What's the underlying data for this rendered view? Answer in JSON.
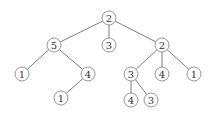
{
  "diagram": {
    "type": "tree",
    "style": {
      "edge_color": "#6e6e6e",
      "node_stroke": "#8a8a8a",
      "node_fill": "#ffffff",
      "label_color": "#333333",
      "node_radius": 7
    },
    "nodes": [
      {
        "id": "n0",
        "label": "2",
        "x": 109,
        "y": 18
      },
      {
        "id": "n1",
        "label": "5",
        "x": 54,
        "y": 45
      },
      {
        "id": "n2",
        "label": "3",
        "x": 109,
        "y": 45
      },
      {
        "id": "n3",
        "label": "2",
        "x": 162,
        "y": 45
      },
      {
        "id": "n4",
        "label": "1",
        "x": 22,
        "y": 74
      },
      {
        "id": "n5",
        "label": "4",
        "x": 88,
        "y": 74
      },
      {
        "id": "n6",
        "label": "1",
        "x": 61,
        "y": 98
      },
      {
        "id": "n7",
        "label": "3",
        "x": 131,
        "y": 74
      },
      {
        "id": "n8",
        "label": "4",
        "x": 162,
        "y": 74
      },
      {
        "id": "n9",
        "label": "1",
        "x": 194,
        "y": 74
      },
      {
        "id": "n10",
        "label": "4",
        "x": 131,
        "y": 100
      },
      {
        "id": "n11",
        "label": "3",
        "x": 151,
        "y": 100
      }
    ],
    "edges": [
      {
        "from": "n0",
        "to": "n1"
      },
      {
        "from": "n0",
        "to": "n2"
      },
      {
        "from": "n0",
        "to": "n3"
      },
      {
        "from": "n1",
        "to": "n4"
      },
      {
        "from": "n1",
        "to": "n5"
      },
      {
        "from": "n5",
        "to": "n6"
      },
      {
        "from": "n3",
        "to": "n7"
      },
      {
        "from": "n3",
        "to": "n8"
      },
      {
        "from": "n3",
        "to": "n9"
      },
      {
        "from": "n7",
        "to": "n10"
      },
      {
        "from": "n7",
        "to": "n11"
      }
    ]
  }
}
